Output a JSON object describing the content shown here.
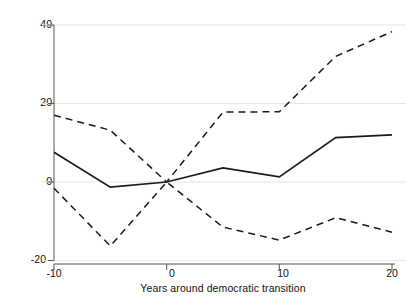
{
  "chart_data": {
    "type": "line",
    "title": "",
    "xlabel": "Years around democratic transition",
    "ylabel": "Percent change of tax revenue as a percentage of GDP",
    "x": [
      -10,
      -5,
      0,
      5,
      10,
      15,
      20
    ],
    "xlim": [
      -11,
      20.5
    ],
    "ylim": [
      -22,
      44
    ],
    "xticks": [
      -10,
      0,
      10,
      20
    ],
    "xtick_labels": [
      "-10",
      "0",
      "10",
      "20"
    ],
    "yticks": [
      -20,
      0,
      20,
      40
    ],
    "ytick_labels": [
      "-20",
      "0",
      "20",
      "40"
    ],
    "grid": "horizontal-gridlines-at-yticks",
    "legend": "none",
    "series": [
      {
        "name": "Upper confidence bound",
        "style": "dashed",
        "color": "#1a1a1a",
        "values": [
          17.0,
          13.2,
          0.0,
          17.8,
          17.9,
          32.0,
          38.3
        ]
      },
      {
        "name": "Point estimate",
        "style": "solid",
        "color": "#1a1a1a",
        "values": [
          7.6,
          -1.3,
          0.0,
          3.6,
          1.3,
          11.3,
          12.0
        ]
      },
      {
        "name": "Lower confidence bound",
        "style": "dashed",
        "color": "#1a1a1a",
        "values": [
          -1.6,
          -16.3,
          0.0,
          -11.5,
          -14.8,
          -9.1,
          -12.8
        ]
      }
    ]
  },
  "axes": {
    "x_tick_labels": [
      "-10",
      "0",
      "10",
      "20"
    ],
    "y_tick_labels": [
      "40",
      "20",
      "0",
      "-20"
    ],
    "x_axis_title": "Years around democratic transition",
    "y_axis_title": "Percent change of tax revenue as a percentage of GDP"
  },
  "colors": {
    "line": "#1a1a1a",
    "gridline": "#e2e2e2",
    "axis": "#555555",
    "background": "#ffffff"
  }
}
